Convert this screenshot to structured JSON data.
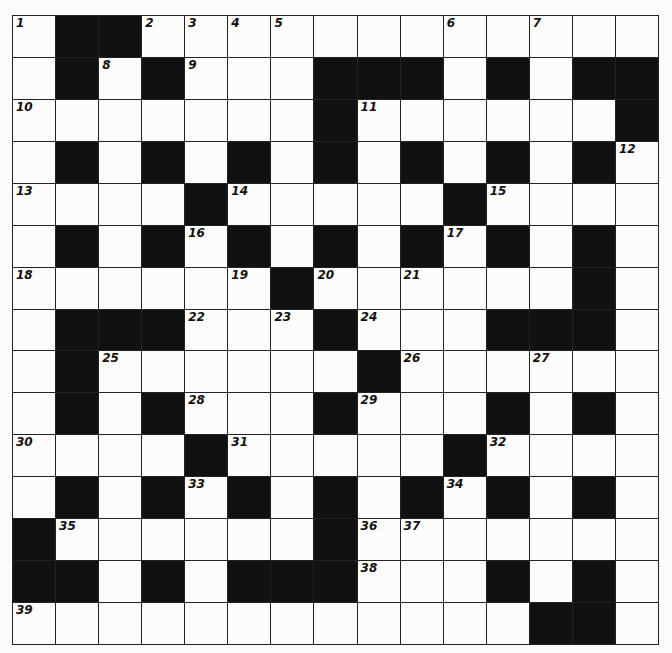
{
  "puzzle": {
    "rows": 15,
    "cols": 15,
    "layout": [
      ".##............",
      ".#.#...###.#.##",
      ".......#......#",
      ".#.#.#.#.#.#.#.",
      "....#.....#....",
      ".#.#.#.#.#.#.#.",
      "......#......#.",
      ".###...#...###.",
      ".#......#......",
      ".#.#...#...#.#.",
      "....#.....#....",
      ".#.#.#.#.#.#.#.",
      "#......#.......",
      "##.#.###...#.#.",
      "............##."
    ],
    "numbers": [
      {
        "r": 0,
        "c": 0,
        "n": "1"
      },
      {
        "r": 0,
        "c": 3,
        "n": "2"
      },
      {
        "r": 0,
        "c": 4,
        "n": "3"
      },
      {
        "r": 0,
        "c": 5,
        "n": "4"
      },
      {
        "r": 0,
        "c": 6,
        "n": "5"
      },
      {
        "r": 0,
        "c": 10,
        "n": "6"
      },
      {
        "r": 0,
        "c": 12,
        "n": "7"
      },
      {
        "r": 1,
        "c": 2,
        "n": "8"
      },
      {
        "r": 1,
        "c": 4,
        "n": "9"
      },
      {
        "r": 2,
        "c": 0,
        "n": "10"
      },
      {
        "r": 2,
        "c": 8,
        "n": "11"
      },
      {
        "r": 3,
        "c": 14,
        "n": "12"
      },
      {
        "r": 4,
        "c": 0,
        "n": "13"
      },
      {
        "r": 4,
        "c": 5,
        "n": "14"
      },
      {
        "r": 4,
        "c": 11,
        "n": "15"
      },
      {
        "r": 5,
        "c": 4,
        "n": "16"
      },
      {
        "r": 5,
        "c": 10,
        "n": "17"
      },
      {
        "r": 6,
        "c": 0,
        "n": "18"
      },
      {
        "r": 6,
        "c": 5,
        "n": "19"
      },
      {
        "r": 6,
        "c": 7,
        "n": "20"
      },
      {
        "r": 6,
        "c": 9,
        "n": "21"
      },
      {
        "r": 7,
        "c": 4,
        "n": "22"
      },
      {
        "r": 7,
        "c": 6,
        "n": "23"
      },
      {
        "r": 7,
        "c": 8,
        "n": "24"
      },
      {
        "r": 8,
        "c": 2,
        "n": "25"
      },
      {
        "r": 8,
        "c": 9,
        "n": "26"
      },
      {
        "r": 8,
        "c": 12,
        "n": "27"
      },
      {
        "r": 9,
        "c": 4,
        "n": "28"
      },
      {
        "r": 9,
        "c": 8,
        "n": "29"
      },
      {
        "r": 10,
        "c": 0,
        "n": "30"
      },
      {
        "r": 10,
        "c": 5,
        "n": "31"
      },
      {
        "r": 10,
        "c": 11,
        "n": "32"
      },
      {
        "r": 11,
        "c": 4,
        "n": "33"
      },
      {
        "r": 11,
        "c": 10,
        "n": "34"
      },
      {
        "r": 12,
        "c": 1,
        "n": "35"
      },
      {
        "r": 12,
        "c": 8,
        "n": "36"
      },
      {
        "r": 12,
        "c": 9,
        "n": "37"
      },
      {
        "r": 13,
        "c": 8,
        "n": "38"
      },
      {
        "r": 14,
        "c": 0,
        "n": "39"
      }
    ]
  }
}
